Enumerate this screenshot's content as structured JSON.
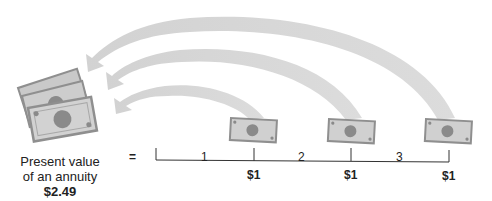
{
  "diagram": {
    "title": "Present value of an annuity",
    "present_value": {
      "line1": "Present value",
      "line2": "of an annuity",
      "amount": "$2.49"
    },
    "equals_sign": "=",
    "timeline": {
      "periods": [
        "1",
        "2",
        "3"
      ],
      "payments": [
        "$1",
        "$1",
        "$1"
      ]
    },
    "colors": {
      "arrow": "#d4d4d4",
      "bill_fill": "#cfcfcf",
      "bill_border": "#8f8f8f",
      "bill_circle": "#8a8a8a",
      "line": "#333333",
      "text": "#222222"
    }
  }
}
